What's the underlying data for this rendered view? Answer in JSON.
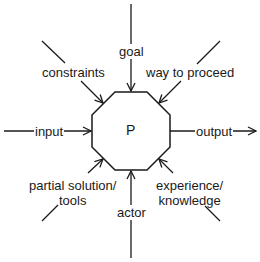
{
  "diagram": {
    "center": {
      "label": "P",
      "shape": "octagon"
    },
    "stroke_color": "#1a1a1a",
    "background": "#ffffff",
    "inputs": [
      {
        "id": "goal",
        "label": "goal",
        "direction": "top"
      },
      {
        "id": "constraints",
        "label": "constraints",
        "direction": "top-left"
      },
      {
        "id": "way_to_proceed",
        "label": "way to proceed",
        "direction": "top-right"
      },
      {
        "id": "input",
        "label": "input",
        "direction": "left"
      },
      {
        "id": "partial_solution",
        "label": "partial solution/\ntools",
        "direction": "bottom-left"
      },
      {
        "id": "actor",
        "label": "actor",
        "direction": "bottom"
      },
      {
        "id": "experience",
        "label": "experience/\nknowledge",
        "direction": "bottom-right"
      }
    ],
    "outputs": [
      {
        "id": "output",
        "label": "output",
        "direction": "right"
      }
    ]
  }
}
